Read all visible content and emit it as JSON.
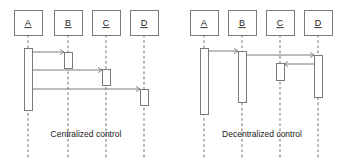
{
  "figure": {
    "type": "uml-sequence-diagram-pair",
    "background": "#ffffff",
    "line_color": "#7a7a7a",
    "label_color": "#1a1a1a",
    "box_fill": "#ffffff",
    "bar_fill": "#ffffff"
  },
  "diagrams": [
    {
      "id": "centralized",
      "caption": "Centralized control",
      "caption_x": 86,
      "caption_y": 137,
      "participants": [
        {
          "label": "A",
          "box_x": 14,
          "box_y": 10,
          "box_w": 28,
          "box_h": 25,
          "lifeline_x": 28,
          "lifeline_y1": 35,
          "lifeline_y2": 158
        },
        {
          "label": "B",
          "box_x": 54,
          "box_y": 10,
          "box_w": 28,
          "box_h": 25,
          "lifeline_x": 68,
          "lifeline_y1": 35,
          "lifeline_y2": 158
        },
        {
          "label": "C",
          "box_x": 92,
          "box_y": 10,
          "box_w": 28,
          "box_h": 25,
          "lifeline_x": 106,
          "lifeline_y1": 35,
          "lifeline_y2": 158
        },
        {
          "label": "D",
          "box_x": 130,
          "box_y": 10,
          "box_w": 28,
          "box_h": 25,
          "lifeline_x": 144,
          "lifeline_y1": 35,
          "lifeline_y2": 158
        }
      ],
      "activations": [
        {
          "owner": "A",
          "x": 24,
          "y": 48,
          "w": 8,
          "h": 62
        },
        {
          "owner": "B",
          "x": 64,
          "y": 52,
          "w": 8,
          "h": 16
        },
        {
          "owner": "C",
          "x": 102,
          "y": 69,
          "w": 8,
          "h": 16
        },
        {
          "owner": "D",
          "x": 140,
          "y": 89,
          "w": 8,
          "h": 16
        }
      ],
      "messages": [
        {
          "from": "A",
          "to": "B",
          "x1": 32,
          "x2": 64,
          "y": 52,
          "direction": "right"
        },
        {
          "from": "A",
          "to": "C",
          "x1": 32,
          "x2": 102,
          "y": 70,
          "direction": "right"
        },
        {
          "from": "A",
          "to": "D",
          "x1": 32,
          "x2": 140,
          "y": 89,
          "direction": "right"
        }
      ]
    },
    {
      "id": "decentralized",
      "caption": "Decentralized control",
      "caption_x": 90,
      "caption_y": 137,
      "participants": [
        {
          "label": "A",
          "box_x": 18,
          "box_y": 10,
          "box_w": 28,
          "box_h": 25,
          "lifeline_x": 32,
          "lifeline_y1": 35,
          "lifeline_y2": 158
        },
        {
          "label": "B",
          "box_x": 56,
          "box_y": 10,
          "box_w": 28,
          "box_h": 25,
          "lifeline_x": 70,
          "lifeline_y1": 35,
          "lifeline_y2": 158
        },
        {
          "label": "C",
          "box_x": 94,
          "box_y": 10,
          "box_w": 28,
          "box_h": 25,
          "lifeline_x": 108,
          "lifeline_y1": 35,
          "lifeline_y2": 158
        },
        {
          "label": "D",
          "box_x": 132,
          "box_y": 10,
          "box_w": 28,
          "box_h": 25,
          "lifeline_x": 146,
          "lifeline_y1": 35,
          "lifeline_y2": 158
        }
      ],
      "activations": [
        {
          "owner": "A",
          "x": 28,
          "y": 48,
          "w": 8,
          "h": 66
        },
        {
          "owner": "B",
          "x": 66,
          "y": 51,
          "w": 8,
          "h": 51
        },
        {
          "owner": "C",
          "x": 104,
          "y": 63,
          "w": 8,
          "h": 17
        },
        {
          "owner": "D",
          "x": 142,
          "y": 55,
          "w": 8,
          "h": 42
        }
      ],
      "messages": [
        {
          "from": "A",
          "to": "B",
          "x1": 36,
          "x2": 66,
          "y": 51,
          "direction": "right"
        },
        {
          "from": "B",
          "to": "D",
          "x1": 74,
          "x2": 142,
          "y": 55,
          "direction": "right"
        },
        {
          "from": "D",
          "to": "C",
          "x1": 142,
          "x2": 112,
          "y": 64,
          "direction": "left"
        }
      ]
    }
  ]
}
